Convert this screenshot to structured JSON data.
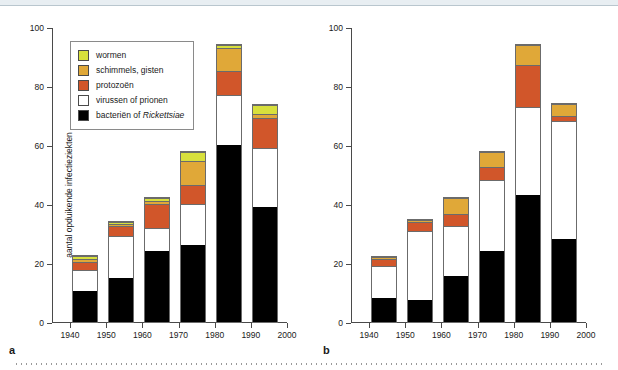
{
  "figure": {
    "panel_a_letter": "a",
    "panel_b_letter": "b"
  },
  "chart_data": [
    {
      "type": "bar",
      "stacked": true,
      "panel": "a",
      "title": "",
      "xlabel": "",
      "ylabel": "aantal opduikende infectieziekten",
      "xlim": [
        1935,
        2000
      ],
      "ylim": [
        0,
        100
      ],
      "yticks": [
        0,
        20,
        40,
        60,
        80,
        100
      ],
      "xticks": [
        1940,
        1950,
        1960,
        1970,
        1980,
        1990,
        2000
      ],
      "categories": [
        "1940",
        "1950",
        "1960",
        "1970",
        "1980",
        "1990"
      ],
      "grid": false,
      "legend_position": "upper-left",
      "series": [
        {
          "name": "bacteriën of Rickettsiae",
          "color": "#000000",
          "values": [
            10.5,
            15,
            24,
            26,
            60,
            39
          ]
        },
        {
          "name": "virussen of prionen",
          "color": "#ffffff",
          "values": [
            7,
            14,
            8,
            14,
            17,
            20
          ]
        },
        {
          "name": "protozoën",
          "color": "#d1562a",
          "values": [
            3,
            3.5,
            8,
            6.5,
            8,
            10
          ]
        },
        {
          "name": "schimmels, gisten",
          "color": "#e0a838",
          "values": [
            0.8,
            0.6,
            1,
            8,
            8,
            1.6
          ]
        },
        {
          "name": "wormen",
          "color": "#d8e03c",
          "values": [
            1.2,
            0.9,
            1,
            3,
            1,
            3
          ]
        }
      ],
      "totals": [
        22.5,
        34,
        42,
        57.5,
        94,
        73.6
      ]
    },
    {
      "type": "bar",
      "stacked": true,
      "panel": "b",
      "title": "",
      "xlabel": "",
      "ylabel": "",
      "xlim": [
        1935,
        2000
      ],
      "ylim": [
        0,
        100
      ],
      "yticks": [
        0,
        20,
        40,
        60,
        80,
        100
      ],
      "xticks": [
        1940,
        1950,
        1960,
        1970,
        1980,
        1990,
        2000
      ],
      "categories": [
        "1940",
        "1950",
        "1960",
        "1970",
        "1980",
        "1990"
      ],
      "grid": false,
      "legend_position": "upper-left",
      "series": [
        {
          "name": "geen zoönose",
          "color": "#000000",
          "values": [
            8,
            7.5,
            15.5,
            24,
            43,
            28
          ]
        },
        {
          "name": "zoönose: uit wilde dieren",
          "color": "#ffffff",
          "values": [
            11,
            23.5,
            17,
            24,
            30,
            40
          ]
        },
        {
          "name": "zoönose: uit niet-wilde dieren",
          "color": "#d1562a",
          "values": [
            2.5,
            3,
            4,
            4.5,
            14,
            2
          ]
        },
        {
          "name": "zoönose: niet nader gespecificeerd",
          "color": "#e0a838",
          "values": [
            0.5,
            0.5,
            5.5,
            5,
            7,
            4
          ]
        }
      ],
      "totals": [
        22,
        34.5,
        42,
        57.5,
        94,
        74
      ]
    }
  ],
  "panel_a": {
    "ylabel": "aantal opduikende infectieziekten",
    "ytick_labels": [
      "0",
      "20",
      "40",
      "60",
      "80",
      "100"
    ],
    "xtick_labels": [
      "1940",
      "1950",
      "1960",
      "1970",
      "1980",
      "1990",
      "2000"
    ],
    "legend": [
      {
        "label": "wormen",
        "color": "#d8e03c",
        "italic_part": ""
      },
      {
        "label": "schimmels, gisten",
        "color": "#e0a838",
        "italic_part": ""
      },
      {
        "label": "protozoën",
        "color": "#d1562a",
        "italic_part": ""
      },
      {
        "label": "virussen of prionen",
        "color": "#ffffff",
        "italic_part": ""
      },
      {
        "label": "bacteriën of ",
        "color": "#000000",
        "italic_part": "Rickettsiae"
      }
    ]
  },
  "panel_b": {
    "ytick_labels": [
      "0",
      "20",
      "40",
      "60",
      "80",
      "100"
    ],
    "xtick_labels": [
      "1940",
      "1950",
      "1960",
      "1970",
      "1980",
      "1990",
      "2000"
    ],
    "legend": [
      {
        "label": "zoönose: niet nader gespecificeerd",
        "color": "#e0a838"
      },
      {
        "label": "zoönose: uit niet-wilde dieren",
        "color": "#d1562a"
      },
      {
        "label": "zoönose: uit wilde dieren",
        "color": "#ffffff"
      },
      {
        "label": "geen zoönose",
        "color": "#000000"
      }
    ]
  }
}
